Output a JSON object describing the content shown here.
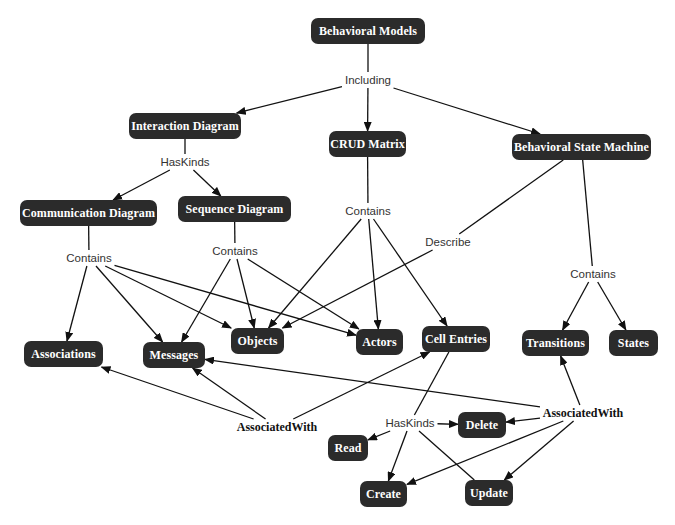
{
  "diagram": {
    "type": "concept-map",
    "colors": {
      "node_fill": "#2b2b2b",
      "node_text": "#ffffff",
      "edge": "#111111",
      "phrase_text": "#333333"
    },
    "nodes": {
      "behavioral_models": {
        "label": "Behavioral Models",
        "x": 311,
        "y": 18,
        "w": 114,
        "h": 26
      },
      "interaction_diagram": {
        "label": "Interaction Diagram",
        "x": 129,
        "y": 113,
        "w": 112,
        "h": 26
      },
      "crud_matrix": {
        "label": "CRUD Matrix",
        "x": 329,
        "y": 131,
        "w": 77,
        "h": 26
      },
      "behavioral_state_machine": {
        "label": "Behavioral State Machine",
        "x": 512,
        "y": 134,
        "w": 139,
        "h": 26
      },
      "communication_diagram": {
        "label": "Communication Diagram",
        "x": 20,
        "y": 200,
        "w": 137,
        "h": 26
      },
      "sequence_diagram": {
        "label": "Sequence Diagram",
        "x": 178,
        "y": 196,
        "w": 113,
        "h": 26
      },
      "associations": {
        "label": "Associations",
        "x": 24,
        "y": 341,
        "w": 79,
        "h": 26
      },
      "messages": {
        "label": "Messages",
        "x": 143,
        "y": 342,
        "w": 62,
        "h": 26
      },
      "objects": {
        "label": "Objects",
        "x": 231,
        "y": 328,
        "w": 53,
        "h": 26
      },
      "actors": {
        "label": "Actors",
        "x": 356,
        "y": 329,
        "w": 47,
        "h": 26
      },
      "cell_entries": {
        "label": "Cell Entries",
        "x": 422,
        "y": 326,
        "w": 68,
        "h": 26
      },
      "transitions": {
        "label": "Transitions",
        "x": 522,
        "y": 330,
        "w": 67,
        "h": 26
      },
      "states": {
        "label": "States",
        "x": 609,
        "y": 330,
        "w": 49,
        "h": 26
      },
      "delete": {
        "label": "Delete",
        "x": 458,
        "y": 412,
        "w": 48,
        "h": 26
      },
      "read": {
        "label": "Read",
        "x": 328,
        "y": 435,
        "w": 40,
        "h": 26
      },
      "create": {
        "label": "Create",
        "x": 360,
        "y": 481,
        "w": 47,
        "h": 26
      },
      "update": {
        "label": "Update",
        "x": 465,
        "y": 480,
        "w": 48,
        "h": 26
      }
    },
    "phrases": {
      "including": {
        "label": "Including",
        "x": 368,
        "y": 80,
        "bold": false
      },
      "haskinds_interaction": {
        "label": "HasKinds",
        "x": 185,
        "y": 162,
        "bold": false
      },
      "contains_crud": {
        "label": "Contains",
        "x": 368,
        "y": 211,
        "bold": false
      },
      "contains_comm": {
        "label": "Contains",
        "x": 89,
        "y": 258,
        "bold": false
      },
      "contains_seq": {
        "label": "Contains",
        "x": 235,
        "y": 251,
        "bold": false
      },
      "describe": {
        "label": "Describe",
        "x": 448,
        "y": 242,
        "bold": false
      },
      "contains_bsm": {
        "label": "Contains",
        "x": 593,
        "y": 274,
        "bold": false
      },
      "associatedwith_left": {
        "label": "AssociatedWith",
        "x": 277,
        "y": 427,
        "bold": true
      },
      "associatedwith_right": {
        "label": "AssociatedWith",
        "x": 583,
        "y": 413,
        "bold": true
      },
      "haskinds_cell": {
        "label": "HasKinds",
        "x": 410,
        "y": 423,
        "bold": false
      }
    },
    "edges": [
      {
        "from": "behavioral_models",
        "to": "including",
        "arrow": false
      },
      {
        "from": "including",
        "to": "interaction_diagram",
        "arrow": true
      },
      {
        "from": "including",
        "to": "crud_matrix",
        "arrow": true
      },
      {
        "from": "including",
        "to": "behavioral_state_machine",
        "arrow": true
      },
      {
        "from": "interaction_diagram",
        "to": "haskinds_interaction",
        "arrow": false
      },
      {
        "from": "haskinds_interaction",
        "to": "communication_diagram",
        "arrow": true
      },
      {
        "from": "haskinds_interaction",
        "to": "sequence_diagram",
        "arrow": true
      },
      {
        "from": "communication_diagram",
        "to": "contains_comm",
        "arrow": false
      },
      {
        "from": "contains_comm",
        "to": "associations",
        "arrow": true
      },
      {
        "from": "contains_comm",
        "to": "messages",
        "arrow": true
      },
      {
        "from": "contains_comm",
        "to": "objects",
        "arrow": true
      },
      {
        "from": "contains_comm",
        "to": "actors",
        "arrow": true
      },
      {
        "from": "sequence_diagram",
        "to": "contains_seq",
        "arrow": false
      },
      {
        "from": "contains_seq",
        "to": "messages",
        "arrow": true
      },
      {
        "from": "contains_seq",
        "to": "objects",
        "arrow": true
      },
      {
        "from": "contains_seq",
        "to": "actors",
        "arrow": true
      },
      {
        "from": "crud_matrix",
        "to": "contains_crud",
        "arrow": false
      },
      {
        "from": "contains_crud",
        "to": "objects",
        "arrow": true
      },
      {
        "from": "contains_crud",
        "to": "actors",
        "arrow": true
      },
      {
        "from": "contains_crud",
        "to": "cell_entries",
        "arrow": true
      },
      {
        "from": "behavioral_state_machine",
        "to": "describe",
        "arrow": false
      },
      {
        "from": "describe",
        "to": "objects",
        "arrow": true
      },
      {
        "from": "behavioral_state_machine",
        "to": "contains_bsm",
        "arrow": false
      },
      {
        "from": "contains_bsm",
        "to": "transitions",
        "arrow": true
      },
      {
        "from": "contains_bsm",
        "to": "states",
        "arrow": true
      },
      {
        "from": "associatedwith_left",
        "to": "associations",
        "arrow": true
      },
      {
        "from": "associatedwith_left",
        "to": "messages",
        "arrow": true
      },
      {
        "from": "associatedwith_left",
        "to": "cell_entries",
        "arrow": true
      },
      {
        "from": "associatedwith_right",
        "to": "messages",
        "arrow": true
      },
      {
        "from": "associatedwith_right",
        "to": "transitions",
        "arrow": true
      },
      {
        "from": "associatedwith_right",
        "to": "delete",
        "arrow": true
      },
      {
        "from": "associatedwith_right",
        "to": "create",
        "arrow": true
      },
      {
        "from": "associatedwith_right",
        "to": "update",
        "arrow": true
      },
      {
        "from": "cell_entries",
        "to": "haskinds_cell",
        "arrow": false
      },
      {
        "from": "haskinds_cell",
        "to": "delete",
        "arrow": true
      },
      {
        "from": "haskinds_cell",
        "to": "read",
        "arrow": true
      },
      {
        "from": "haskinds_cell",
        "to": "create",
        "arrow": true
      },
      {
        "from": "haskinds_cell",
        "to": "update",
        "arrow": false
      }
    ]
  }
}
